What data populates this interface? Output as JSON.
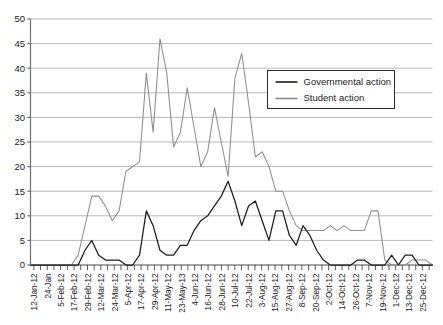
{
  "chart_data": {
    "type": "line",
    "title": "",
    "subtitle": "",
    "xlabel": "",
    "ylabel": "",
    "ylim": [
      0,
      50
    ],
    "ytick_step": 5,
    "yticks": [
      "0",
      "5",
      "10",
      "15",
      "20",
      "25",
      "30",
      "35",
      "40",
      "45",
      "50"
    ],
    "grid": "horizontal",
    "legend_position": "upper-right",
    "legend": [
      "Governmental action",
      "Student action"
    ],
    "colors": {
      "governmental_action": "#1c1c1c",
      "student_action": "#8d8d8d",
      "gridline": "#9a9a9a",
      "axis": "#6f6f6f",
      "background": "#ffffff"
    },
    "xtick_labels": [
      "12-Jan-12",
      "24-Jan",
      "5-Feb-12",
      "17-Feb-12",
      "29-Feb-12",
      "12-Mar-12",
      "24-Mar-12",
      "5-Apr-12",
      "17-Apr-12",
      "29-Apr-12",
      "11-May-12",
      "23-May-13",
      "4-Jun-12",
      "16-Jun-12",
      "28-Jun-12",
      "10-Jul-12",
      "22-Jul-12",
      "3-Aug-12",
      "15-Aug-12",
      "27-Aug-12",
      "8-Sep-12",
      "20-Sep-12",
      "2-Oct-12",
      "14-Oct-12",
      "26-Oct-12",
      "7-Nov-12",
      "19-Nov-12",
      "1-Dec-12",
      "13-Dec-12",
      "25-Dec-12"
    ],
    "x_label_interval": 2,
    "n_points": 60,
    "series": [
      {
        "name": "Governmental action",
        "color": "#1c1c1c",
        "values": [
          0,
          0,
          0,
          0,
          0,
          0,
          0,
          0,
          3,
          5,
          2,
          1,
          1,
          1,
          0,
          0,
          2,
          11,
          8,
          3,
          2,
          2,
          4,
          4,
          7,
          9,
          10,
          12,
          14,
          17,
          13,
          8,
          12,
          13,
          9,
          5,
          11,
          11,
          6,
          4,
          8,
          6,
          3,
          1,
          0,
          0,
          0,
          0,
          1,
          1,
          0,
          0,
          0,
          2,
          0,
          2,
          2,
          0,
          0,
          0
        ]
      },
      {
        "name": "Student action",
        "color": "#8d8d8d",
        "values": [
          0,
          0,
          0,
          0,
          0,
          0,
          0,
          2,
          8,
          14,
          14,
          12,
          9,
          11,
          19,
          20,
          21,
          39,
          27,
          46,
          39,
          24,
          27,
          36,
          28,
          20,
          23,
          32,
          25,
          18,
          38,
          43,
          33,
          22,
          23,
          20,
          15,
          15,
          11,
          8,
          7,
          7,
          7,
          7,
          8,
          7,
          8,
          7,
          7,
          7,
          11,
          11,
          1,
          0,
          0,
          0,
          1,
          1,
          1,
          0
        ]
      }
    ],
    "annotations": []
  }
}
